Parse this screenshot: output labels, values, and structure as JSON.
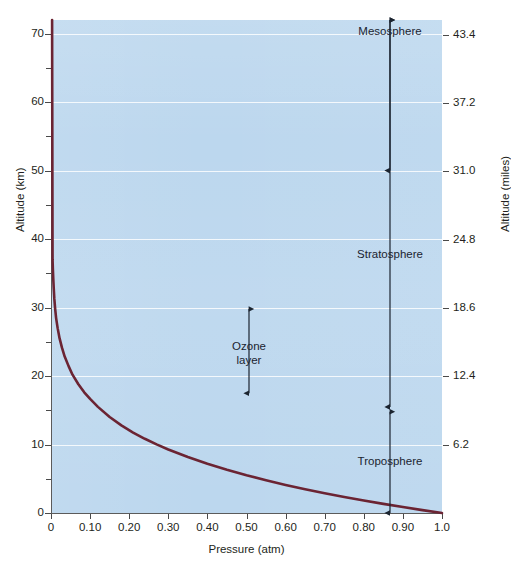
{
  "chart_data": {
    "type": "line",
    "title": "",
    "xlabel": "Pressure (atm)",
    "ylabel": "Altitude (km)",
    "ylabel_secondary": "Altitude (miles)",
    "xlim": [
      0,
      1.0
    ],
    "ylim": [
      0,
      72
    ],
    "grid": true,
    "legend": "none",
    "x_ticks": [
      "0",
      "0.10",
      "0.20",
      "0.30",
      "0.40",
      "0.50",
      "0.60",
      "0.70",
      "0.80",
      "0.90",
      "1.0"
    ],
    "x_tick_values": [
      0,
      0.1,
      0.2,
      0.3,
      0.4,
      0.5,
      0.6,
      0.7,
      0.8,
      0.9,
      1.0
    ],
    "y_ticks_km": [
      "0",
      "10",
      "20",
      "30",
      "40",
      "50",
      "60",
      "70"
    ],
    "y_tick_values_km": [
      0,
      10,
      20,
      30,
      40,
      50,
      60,
      70
    ],
    "y_minor_ticks_km": [
      5,
      15,
      25,
      35,
      45,
      55,
      65
    ],
    "y_ticks_miles": [
      "6.2",
      "12.4",
      "18.6",
      "24.8",
      "31.0",
      "37.2",
      "43.4"
    ],
    "y_tick_values_miles": [
      6.2,
      12.4,
      18.6,
      24.8,
      31.0,
      37.2,
      43.4
    ],
    "series": [
      {
        "name": "Atmospheric pressure vs altitude",
        "color": "#6b2433",
        "x": [
          1.0,
          0.95,
          0.9,
          0.85,
          0.8,
          0.75,
          0.7,
          0.65,
          0.6,
          0.55,
          0.5,
          0.45,
          0.4,
          0.35,
          0.3,
          0.27,
          0.24,
          0.21,
          0.18,
          0.15,
          0.12,
          0.1,
          0.085,
          0.07,
          0.055,
          0.045,
          0.035,
          0.028,
          0.022,
          0.017,
          0.013,
          0.0105,
          0.0085,
          0.007,
          0.0058,
          0.0048,
          0.004
        ],
        "y": [
          0,
          0.42,
          0.87,
          1.33,
          1.82,
          2.34,
          2.89,
          3.48,
          4.1,
          4.78,
          5.51,
          6.31,
          7.19,
          8.18,
          9.28,
          10.02,
          10.84,
          11.75,
          12.8,
          14.02,
          15.5,
          16.66,
          17.63,
          18.81,
          20.2,
          21.45,
          22.85,
          24.15,
          25.5,
          27.0,
          28.5,
          29.9,
          31.3,
          32.8,
          34.2,
          35.6,
          37.0
        ]
      }
    ],
    "annotations": [
      {
        "id": "mesosphere",
        "label": "Mesosphere",
        "from_km": 50.0,
        "to_km": 72.0
      },
      {
        "id": "stratosphere",
        "label": "Stratosphere",
        "from_km": 15.5,
        "to_km": 72.0
      },
      {
        "id": "troposphere",
        "label": "Troposphere",
        "from_km": 0.0,
        "to_km": 14.8
      },
      {
        "id": "ozone-layer",
        "label_line1": "Ozone",
        "label_line2": "layer",
        "from_km": 17.5,
        "to_km": 29.8
      }
    ],
    "colors": {
      "plot_background": "#bcd7ee",
      "curve": "#6b2433",
      "gridline": "#ffffff",
      "axis": "#5b5b5b",
      "text": "#231f20",
      "annotation": "#1b2430"
    }
  },
  "axes": {
    "x_title": "Pressure (atm)",
    "y_left_title": "Altitude (km)",
    "y_right_title": "Altitude (miles)"
  },
  "labels": {
    "mesosphere": "Mesosphere",
    "stratosphere": "Stratosphere",
    "troposphere": "Troposphere",
    "ozone_line1": "Ozone",
    "ozone_line2": "layer"
  }
}
